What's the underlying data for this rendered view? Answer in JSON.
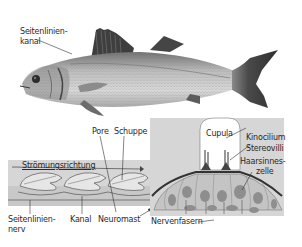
{
  "figure": {
    "fish_labels": {
      "lateral_line_canal": [
        "Seitenlinien-",
        "kanal"
      ]
    },
    "canal_panel": {
      "flow_direction": "Strömungsrichtung",
      "pore": "Pore",
      "scale": "Schuppe",
      "lateral_line_nerve": [
        "Seitenlinien-",
        "nerv"
      ],
      "canal": "Kanal",
      "neuromast": "Neuromast"
    },
    "neuromast_panel": {
      "cupula": "Cupula",
      "kinocilium": "Kinocilium",
      "stereovilli": "Stereovilli",
      "hair_cell": [
        "Haarsinnes-",
        "zelle"
      ],
      "nerve_fibers": "Nervenfasern"
    },
    "colors": {
      "panel_bg": "#d6d6d6",
      "panel_dark": "#b9b9b9",
      "fish_body": "#a8a8a8",
      "fin_dark": "#3c3c3c",
      "cell_fill": "#c4c4c4",
      "nucleus": "#8e8e8e",
      "line": "#333333"
    }
  }
}
